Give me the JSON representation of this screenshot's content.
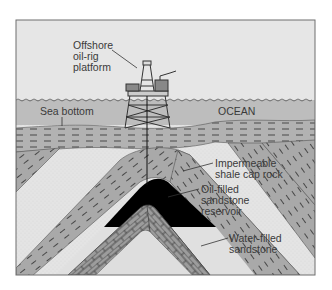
{
  "diagram": {
    "colors": {
      "sky": "#e6e6e6",
      "ocean": "#bdbdbd",
      "shale": "#a9a9a9",
      "sandstone": "#e2e2e2",
      "oil": "#000000",
      "limestone": "#999999",
      "frame": "#6e6e6e"
    },
    "labels": {
      "rig": [
        "Offshore",
        "oil-rig",
        "platform"
      ],
      "sea_bottom": "Sea bottom",
      "ocean": "OCEAN",
      "cap_rock": [
        "Impermeable",
        "shale cap rock"
      ],
      "oil_reservoir": [
        "Oil-filled",
        "sandstone",
        "reservoir"
      ],
      "water_sandstone": [
        "Water-filled",
        "sandstone"
      ]
    }
  }
}
